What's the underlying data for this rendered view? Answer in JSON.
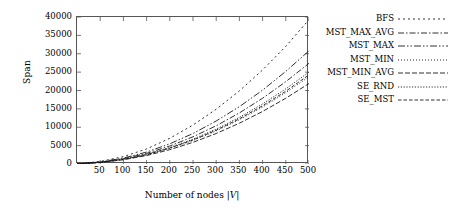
{
  "chart_data": {
    "type": "line",
    "title": "",
    "xlabel": "Number of nodes |V|",
    "ylabel": "Span",
    "xlim": [
      0,
      500
    ],
    "ylim": [
      0,
      40000
    ],
    "grid": false,
    "legend_position": "right-outside",
    "xticks": [
      50,
      100,
      150,
      200,
      250,
      300,
      350,
      400,
      450,
      500
    ],
    "yticks": [
      0,
      5000,
      10000,
      15000,
      20000,
      25000,
      30000,
      35000,
      40000
    ],
    "x": [
      0,
      50,
      100,
      150,
      200,
      250,
      300,
      350,
      400,
      450,
      500
    ],
    "series": [
      {
        "name": "BFS",
        "dash": "2,3",
        "values": [
          0,
          700,
          2000,
          4100,
          7000,
          10600,
          14900,
          19900,
          25600,
          32000,
          39300
        ]
      },
      {
        "name": "MST_MAX_AVG",
        "dash": "6,2,1.5,2",
        "values": [
          0,
          500,
          1450,
          2900,
          4900,
          7400,
          10400,
          13900,
          17900,
          22400,
          27400
        ]
      },
      {
        "name": "MST_MAX",
        "dash": "7,2,1.5,2,1.5,2",
        "values": [
          0,
          560,
          1620,
          3250,
          5500,
          8300,
          11700,
          15600,
          20100,
          25200,
          30800
        ]
      },
      {
        "name": "MST_MIN",
        "dash": "1,2",
        "values": [
          0,
          430,
          1250,
          2500,
          4250,
          6400,
          9000,
          12050,
          15500,
          19400,
          23750
        ]
      },
      {
        "name": "MST_MIN_AVG",
        "dash": "5,2",
        "values": [
          0,
          400,
          1150,
          2300,
          3900,
          5900,
          8300,
          11100,
          14300,
          17900,
          21900
        ]
      },
      {
        "name": "SE_RND",
        "dash": "1.2,1.6",
        "values": [
          0,
          455,
          1320,
          2640,
          4480,
          6750,
          9500,
          12700,
          16350,
          20450,
          25000
        ]
      },
      {
        "name": "SE_MST",
        "dash": "3.5,2",
        "values": [
          0,
          440,
          1280,
          2560,
          4340,
          6550,
          9200,
          12300,
          15850,
          19800,
          24250
        ]
      }
    ]
  },
  "axis": {
    "ylabel": "Span",
    "xlabel_prefix": "Number of nodes ",
    "xlabel_math": "|V|"
  },
  "legend": {
    "items": [
      {
        "label": "BFS"
      },
      {
        "label": "MST_MAX_AVG"
      },
      {
        "label": "MST_MAX"
      },
      {
        "label": "MST_MIN"
      },
      {
        "label": "MST_MIN_AVG"
      },
      {
        "label": "SE_RND"
      },
      {
        "label": "SE_MST"
      }
    ]
  },
  "colors": {
    "axis": "#555555",
    "line": "#1a1a1a",
    "background": "#ffffff"
  }
}
